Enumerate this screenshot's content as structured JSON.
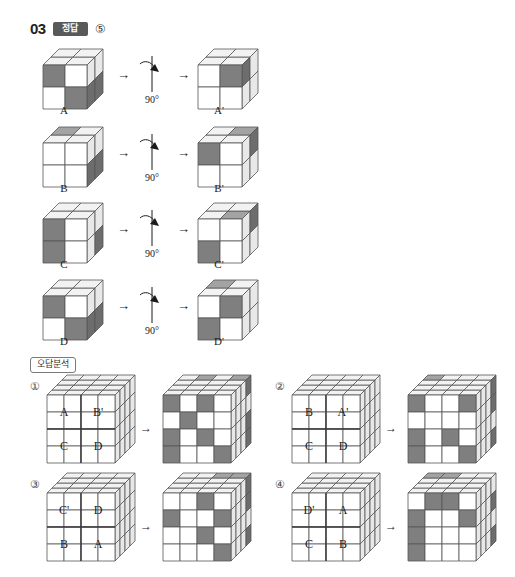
{
  "header": {
    "question_number": "03",
    "answer_badge": "정답",
    "answer_value": "⑤"
  },
  "section": {
    "label": "오답분석"
  },
  "colors": {
    "dark_face": "#7f7f7f",
    "dark_face_top": "#a3a3a3",
    "dark_face_side": "#6d6d6d",
    "white_face": "#ffffff",
    "white_face_top": "#f2f2f2",
    "white_face_side": "#e8e8e8",
    "stroke": "#555555",
    "badge_bg": "#595959",
    "text": "#1a1a1a"
  },
  "transformations": [
    {
      "id": "row-a",
      "source_label": "A",
      "result_label": "A'",
      "rotation_label": "90°",
      "rotation_axis": "vertical",
      "source_front": [
        [
          "dark",
          "white"
        ],
        [
          "white",
          "dark"
        ]
      ],
      "source_top": [
        [
          "white",
          "white"
        ],
        [
          "white",
          "white"
        ]
      ],
      "source_side": [
        [
          "white",
          "white"
        ],
        [
          "dark",
          "dark"
        ]
      ],
      "result_front": [
        [
          "white",
          "dark"
        ],
        [
          "white",
          "white"
        ]
      ],
      "result_top": [
        [
          "white",
          "white"
        ],
        [
          "white",
          "white"
        ]
      ],
      "result_side": [
        [
          "white",
          "dark"
        ],
        [
          "white",
          "white"
        ]
      ]
    },
    {
      "id": "row-b",
      "source_label": "B",
      "result_label": "B'",
      "rotation_label": "90°",
      "rotation_axis": "vertical",
      "source_front": [
        [
          "white",
          "white"
        ],
        [
          "white",
          "white"
        ]
      ],
      "source_top": [
        [
          "dark",
          "white"
        ],
        [
          "white",
          "white"
        ]
      ],
      "source_side": [
        [
          "white",
          "white"
        ],
        [
          "dark",
          "dark"
        ]
      ],
      "result_front": [
        [
          "dark",
          "white"
        ],
        [
          "white",
          "white"
        ]
      ],
      "result_top": [
        [
          "white",
          "dark"
        ],
        [
          "white",
          "white"
        ]
      ],
      "result_side": [
        [
          "dark",
          "white"
        ],
        [
          "white",
          "white"
        ]
      ]
    },
    {
      "id": "row-c",
      "source_label": "C",
      "result_label": "C'",
      "rotation_label": "90°",
      "rotation_axis": "vertical",
      "source_front": [
        [
          "dark",
          "white"
        ],
        [
          "dark",
          "white"
        ]
      ],
      "source_top": [
        [
          "white",
          "white"
        ],
        [
          "white",
          "white"
        ]
      ],
      "source_side": [
        [
          "white",
          "white"
        ],
        [
          "dark",
          "white"
        ]
      ],
      "result_front": [
        [
          "white",
          "white"
        ],
        [
          "dark",
          "white"
        ]
      ],
      "result_top": [
        [
          "white",
          "white"
        ],
        [
          "white",
          "dark"
        ]
      ],
      "result_side": [
        [
          "dark",
          "white"
        ],
        [
          "white",
          "white"
        ]
      ]
    },
    {
      "id": "row-d",
      "source_label": "D",
      "result_label": "D'",
      "rotation_label": "90°",
      "rotation_axis": "vertical",
      "source_front": [
        [
          "dark",
          "white"
        ],
        [
          "white",
          "dark"
        ]
      ],
      "source_top": [
        [
          "white",
          "white"
        ],
        [
          "white",
          "white"
        ]
      ],
      "source_side": [
        [
          "white",
          "white"
        ],
        [
          "dark",
          "dark"
        ]
      ],
      "result_front": [
        [
          "white",
          "dark"
        ],
        [
          "dark",
          "white"
        ]
      ],
      "result_top": [
        [
          "dark",
          "white"
        ],
        [
          "white",
          "white"
        ]
      ],
      "result_side": [
        [
          "white",
          "white"
        ],
        [
          "white",
          "white"
        ]
      ]
    }
  ],
  "options": [
    {
      "id": "option-1",
      "number": "①",
      "quadrant_labels": [
        [
          "A",
          "B'"
        ],
        [
          "C",
          "D"
        ]
      ],
      "result_front": [
        [
          "dark",
          "white",
          "dark",
          "white"
        ],
        [
          "white",
          "dark",
          "white",
          "white"
        ],
        [
          "dark",
          "white",
          "dark",
          "white"
        ],
        [
          "dark",
          "white",
          "white",
          "dark"
        ]
      ],
      "result_top": [
        [
          "white",
          "dark",
          "white",
          "dark"
        ],
        [
          "white",
          "white",
          "white",
          "white"
        ],
        [
          "white",
          "white",
          "white",
          "white"
        ],
        [
          "white",
          "white",
          "white",
          "white"
        ]
      ],
      "result_side": [
        [
          "dark",
          "white",
          "white",
          "white"
        ],
        [
          "white",
          "white",
          "white",
          "white"
        ],
        [
          "dark",
          "white",
          "white",
          "white"
        ],
        [
          "dark",
          "white",
          "white",
          "white"
        ]
      ]
    },
    {
      "id": "option-2",
      "number": "②",
      "quadrant_labels": [
        [
          "B",
          "A'"
        ],
        [
          "C",
          "D"
        ]
      ],
      "result_front": [
        [
          "dark",
          "white",
          "white",
          "dark"
        ],
        [
          "white",
          "white",
          "white",
          "white"
        ],
        [
          "dark",
          "white",
          "dark",
          "white"
        ],
        [
          "dark",
          "white",
          "white",
          "dark"
        ]
      ],
      "result_top": [
        [
          "dark",
          "white",
          "white",
          "white"
        ],
        [
          "white",
          "white",
          "white",
          "white"
        ],
        [
          "white",
          "white",
          "white",
          "white"
        ],
        [
          "white",
          "white",
          "white",
          "white"
        ]
      ],
      "result_side": [
        [
          "dark",
          "white",
          "white",
          "white"
        ],
        [
          "dark",
          "white",
          "white",
          "white"
        ],
        [
          "white",
          "white",
          "white",
          "white"
        ],
        [
          "dark",
          "white",
          "white",
          "white"
        ]
      ]
    },
    {
      "id": "option-3",
      "number": "③",
      "quadrant_labels": [
        [
          "C'",
          "D"
        ],
        [
          "B",
          "A"
        ]
      ],
      "result_front": [
        [
          "white",
          "white",
          "dark",
          "white"
        ],
        [
          "dark",
          "white",
          "white",
          "dark"
        ],
        [
          "white",
          "white",
          "dark",
          "white"
        ],
        [
          "white",
          "white",
          "white",
          "dark"
        ]
      ],
      "result_top": [
        [
          "white",
          "white",
          "dark",
          "dark"
        ],
        [
          "white",
          "white",
          "white",
          "white"
        ],
        [
          "white",
          "white",
          "white",
          "white"
        ],
        [
          "white",
          "white",
          "white",
          "white"
        ]
      ],
      "result_side": [
        [
          "dark",
          "white",
          "white",
          "white"
        ],
        [
          "dark",
          "white",
          "white",
          "white"
        ],
        [
          "white",
          "white",
          "white",
          "white"
        ],
        [
          "dark",
          "white",
          "white",
          "white"
        ]
      ]
    },
    {
      "id": "option-4",
      "number": "④",
      "quadrant_labels": [
        [
          "D'",
          "A"
        ],
        [
          "C",
          "B"
        ]
      ],
      "result_front": [
        [
          "white",
          "dark",
          "dark",
          "white"
        ],
        [
          "dark",
          "white",
          "white",
          "dark"
        ],
        [
          "dark",
          "white",
          "white",
          "white"
        ],
        [
          "dark",
          "white",
          "white",
          "white"
        ]
      ],
      "result_top": [
        [
          "dark",
          "dark",
          "white",
          "white"
        ],
        [
          "white",
          "white",
          "white",
          "white"
        ],
        [
          "white",
          "white",
          "white",
          "white"
        ],
        [
          "white",
          "white",
          "white",
          "white"
        ]
      ],
      "result_side": [
        [
          "white",
          "white",
          "white",
          "white"
        ],
        [
          "dark",
          "white",
          "white",
          "white"
        ],
        [
          "white",
          "white",
          "white",
          "white"
        ],
        [
          "dark",
          "white",
          "white",
          "white"
        ]
      ]
    }
  ],
  "arrow_glyph": "→"
}
